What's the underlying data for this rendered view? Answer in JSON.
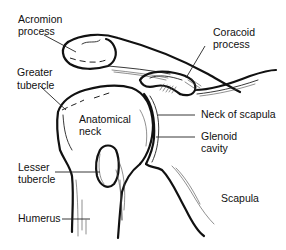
{
  "diagram": {
    "labels": {
      "acromion": [
        "Acromion",
        "process"
      ],
      "coracoid": [
        "Coracoid",
        "process"
      ],
      "greater_tubercle": [
        "Greater",
        "tubercle"
      ],
      "anatomical_neck": [
        "Anatomical",
        "neck"
      ],
      "neck_of_scapula": [
        "Neck of scapula"
      ],
      "glenoid_cavity": [
        "Glenoid",
        "cavity"
      ],
      "lesser_tubercle": [
        "Lesser",
        "tubercle"
      ],
      "scapula": [
        "Scapula"
      ],
      "humerus": [
        "Humerus"
      ]
    },
    "colors": {
      "ink": "#111111",
      "background": "#ffffff"
    }
  }
}
